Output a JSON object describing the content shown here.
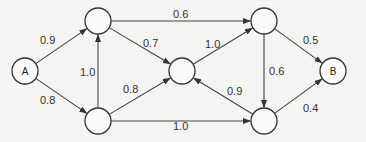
{
  "diagram": {
    "type": "directed-weighted-graph",
    "nodes": [
      {
        "id": "A",
        "label": "A",
        "x": 25,
        "y": 71
      },
      {
        "id": "n1",
        "label": "",
        "x": 98,
        "y": 21
      },
      {
        "id": "n2",
        "label": "",
        "x": 98,
        "y": 121
      },
      {
        "id": "n3",
        "label": "",
        "x": 182,
        "y": 71
      },
      {
        "id": "n4",
        "label": "",
        "x": 264,
        "y": 21
      },
      {
        "id": "n5",
        "label": "",
        "x": 264,
        "y": 121
      },
      {
        "id": "B",
        "label": "B",
        "x": 333,
        "y": 71
      }
    ],
    "edges": [
      {
        "from": "A",
        "to": "n1",
        "weight": "0.9",
        "lx": 40,
        "ly": 44
      },
      {
        "from": "A",
        "to": "n2",
        "weight": "0.8",
        "lx": 40,
        "ly": 104
      },
      {
        "from": "n2",
        "to": "n1",
        "weight": "1.0",
        "lx": 80,
        "ly": 76
      },
      {
        "from": "n1",
        "to": "n4",
        "weight": "0.6",
        "lx": 173,
        "ly": 18
      },
      {
        "from": "n1",
        "to": "n3",
        "weight": "0.7",
        "lx": 143,
        "ly": 47
      },
      {
        "from": "n2",
        "to": "n3",
        "weight": "0.8",
        "lx": 123,
        "ly": 93
      },
      {
        "from": "n2",
        "to": "n5",
        "weight": "1.0",
        "lx": 173,
        "ly": 130
      },
      {
        "from": "n3",
        "to": "n4",
        "weight": "1.0",
        "lx": 205,
        "ly": 48
      },
      {
        "from": "n5",
        "to": "n3",
        "weight": "0.9",
        "lx": 227,
        "ly": 95
      },
      {
        "from": "n4",
        "to": "n5",
        "weight": "0.6",
        "lx": 269,
        "ly": 75
      },
      {
        "from": "n4",
        "to": "B",
        "weight": "0.5",
        "lx": 303,
        "ly": 44
      },
      {
        "from": "n5",
        "to": "B",
        "weight": "0.4",
        "lx": 303,
        "ly": 112
      }
    ],
    "node_radius": 13
  }
}
